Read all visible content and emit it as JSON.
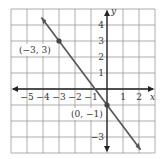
{
  "chart_data": {
    "type": "line",
    "title": "",
    "xlabel": "x",
    "ylabel": "y",
    "xlim": [
      -6,
      3
    ],
    "ylim": [
      -4,
      5
    ],
    "grid": true,
    "x_ticks": [
      "−5",
      "−4",
      "−3",
      "−2",
      "−1",
      "1",
      "2"
    ],
    "y_ticks": [
      "4",
      "3",
      "2",
      "1",
      "−3"
    ],
    "series": [
      {
        "name": "line",
        "equation": "y = -4/3 x - 1",
        "x": [
          -3,
          0
        ],
        "y": [
          3,
          -1
        ]
      }
    ],
    "points": [
      {
        "label": "(−3, 3)",
        "x": -3,
        "y": 3
      },
      {
        "label": "(0, −1)",
        "x": 0,
        "y": -1
      }
    ],
    "line_color": "#555555"
  }
}
